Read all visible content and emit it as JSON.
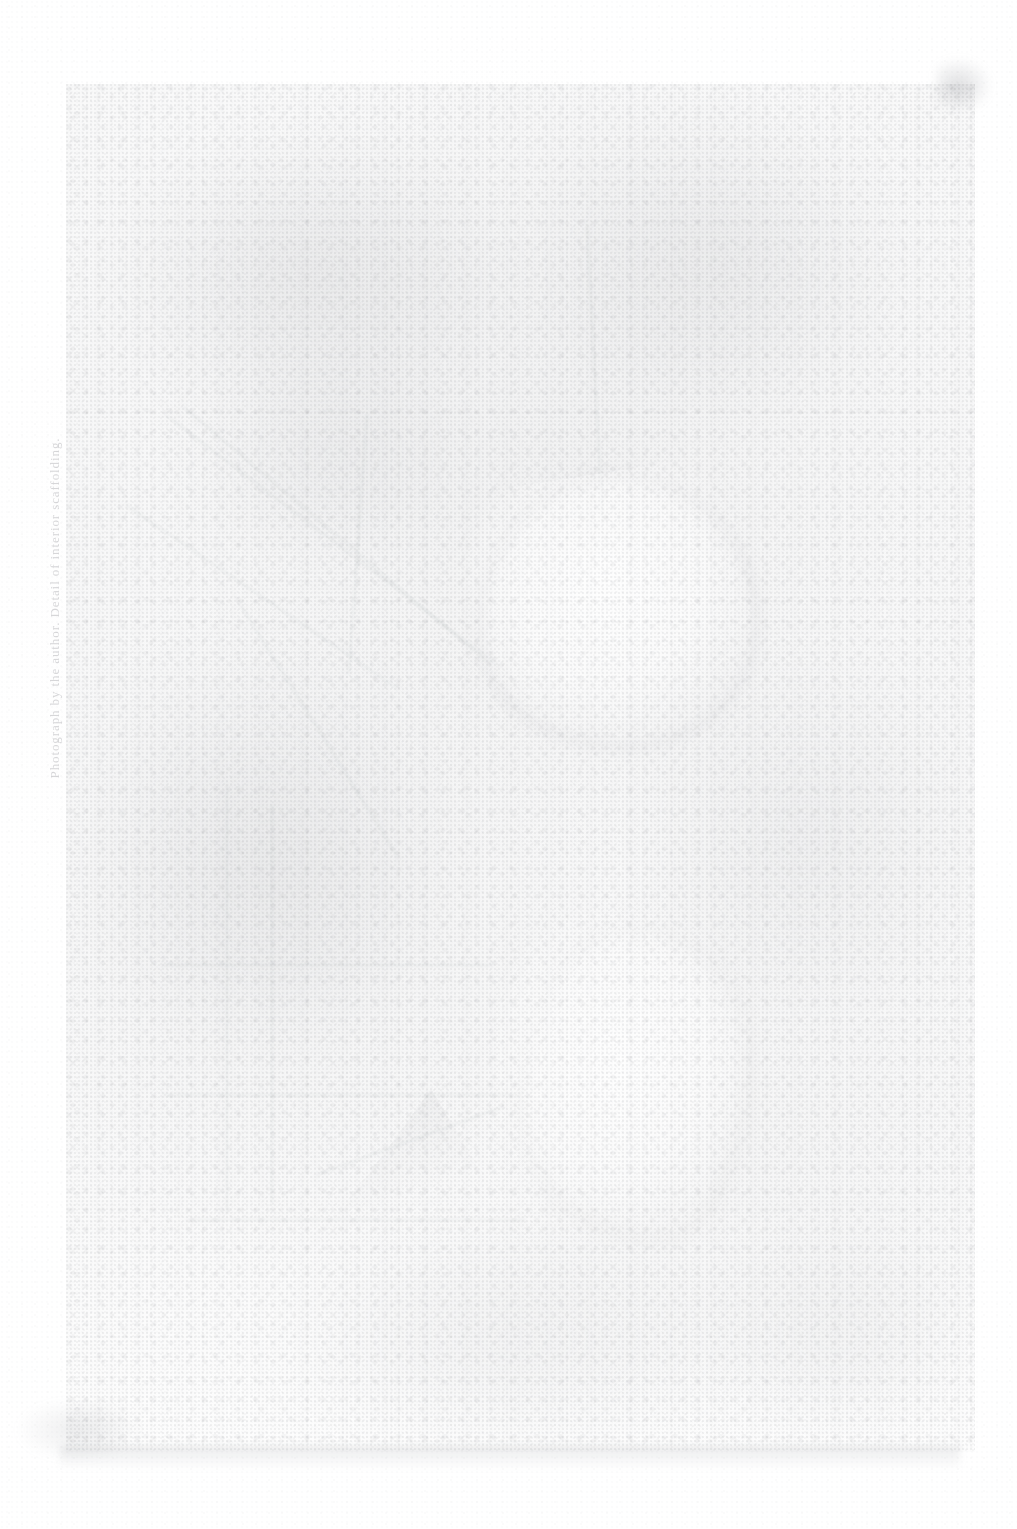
{
  "document": {
    "type": "scanned-photographic-plate",
    "condition": "severely faded / washed out halftone scan",
    "sheet": {
      "width_px": 1017,
      "height_px": 1529,
      "background_color": "#ffffff"
    }
  },
  "plate": {
    "name": "printed-halftone-plate",
    "left_px": 66,
    "top_px": 84,
    "width_px": 909,
    "height_px": 1368,
    "ink_tone": "#8e9096",
    "paper_tone": "#fdfdfd",
    "description": "Nearly bleached rectangular halftone image occupying most of the sheet"
  },
  "margin": {
    "caption": {
      "name": "rotated-margin-caption",
      "text": "Photograph by the author. Detail of interior scaffolding.",
      "orientation": "vertical-rotated-90-ccw",
      "legibility": "illegible / near-threshold",
      "color": "#7a7c82"
    }
  },
  "forms": {
    "figures": [
      {
        "label": "upper-figure-highlight",
        "note": "bright oval mass, upper centre"
      },
      {
        "label": "lower-figure-highlight",
        "note": "bright vertical mass, lower centre"
      }
    ],
    "structure": [
      {
        "label": "diagonal-beams",
        "note": "faint diagonal lines upper left"
      },
      {
        "label": "vertical-posts",
        "note": "two faint vertical lines lower left"
      },
      {
        "label": "horizontal-rails",
        "note": "three faint horizontal lines lower left"
      },
      {
        "label": "truss-triangle",
        "note": "small triangular mass, lower centre-left"
      }
    ]
  },
  "artifacts": {
    "items": [
      {
        "label": "top-right-smudge",
        "note": "small dark fleck near top right corner"
      },
      {
        "label": "bottom-left-flecks",
        "note": "faint specks in lower left margin"
      },
      {
        "label": "bottom-edge-band",
        "note": "soft grey band along lower plate edge"
      },
      {
        "label": "vertical-scan-streaks",
        "note": "regular vertical banding across plate"
      },
      {
        "label": "halftone-grain",
        "note": "dense dot grain throughout plate"
      }
    ]
  }
}
